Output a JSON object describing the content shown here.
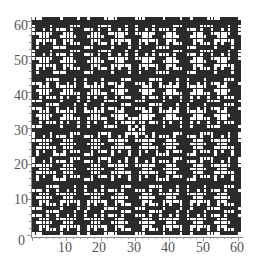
{
  "chart_data": {
    "type": "heatmap",
    "title": "",
    "xlabel": "",
    "ylabel": "",
    "xlim": [
      0,
      60
    ],
    "ylim": [
      0,
      60
    ],
    "grid_size": 61,
    "cell_colors": {
      "on": "#ffffff",
      "off": "#2a2a2a"
    },
    "x_ticks": [
      0,
      10,
      20,
      30,
      40,
      50,
      60
    ],
    "y_ticks": [
      0,
      10,
      20,
      30,
      40,
      50,
      60
    ]
  },
  "axes": {
    "x_tick_labels": [
      "0",
      "10",
      "20",
      "30",
      "40",
      "50",
      "60"
    ],
    "y_tick_labels": [
      "10",
      "20",
      "30",
      "40",
      "50",
      "60"
    ],
    "origin_label": "0"
  }
}
